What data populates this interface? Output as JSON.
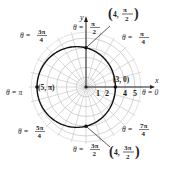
{
  "chart_data": {
    "type": "line",
    "subtype": "polar",
    "equation": "r = 4 - cos θ",
    "title": "",
    "axes": {
      "x_label": "x",
      "y_label": "y"
    },
    "radial_ticks": [
      "1",
      "2",
      "3",
      "4",
      "5"
    ],
    "grid": {
      "circles": [
        1,
        2,
        3,
        4,
        5
      ],
      "spokes_deg": 15,
      "on": true
    },
    "angle_labels": [
      {
        "id": "theta0",
        "text": "θ = 0",
        "num": "",
        "den": ""
      },
      {
        "id": "theta_pi4",
        "text": "θ =",
        "num": "π",
        "den": "4"
      },
      {
        "id": "theta_pi2",
        "text": "θ =",
        "num": "π",
        "den": "2"
      },
      {
        "id": "theta_3pi4",
        "text": "θ =",
        "num": "3π",
        "den": "4"
      },
      {
        "id": "theta_pi",
        "text": "θ = π",
        "num": "",
        "den": ""
      },
      {
        "id": "theta_5pi4",
        "text": "θ =",
        "num": "5π",
        "den": "4"
      },
      {
        "id": "theta_3pi2",
        "text": "θ =",
        "num": "3π",
        "den": "2"
      },
      {
        "id": "theta_7pi4",
        "text": "θ =",
        "num": "7π",
        "den": "4"
      }
    ],
    "points": [
      {
        "label": "(3, 0)",
        "r": 3,
        "theta": "0"
      },
      {
        "label": "(4, π/2)",
        "r": 4,
        "theta": "π/2",
        "num": "π",
        "den": "2"
      },
      {
        "label": "(5, π)",
        "r": 5,
        "theta": "π"
      },
      {
        "label": "(4, 3π/2)",
        "r": 4,
        "theta": "3π/2",
        "num": "3π",
        "den": "2"
      }
    ],
    "series": [
      {
        "name": "r = 4 - cos θ",
        "theta_deg": [
          0,
          30,
          60,
          90,
          120,
          150,
          180,
          210,
          240,
          270,
          300,
          330,
          360
        ],
        "r": [
          3,
          3.13,
          3.5,
          4,
          4.5,
          4.87,
          5,
          4.87,
          4.5,
          4,
          3.5,
          3.13,
          3
        ]
      }
    ]
  }
}
